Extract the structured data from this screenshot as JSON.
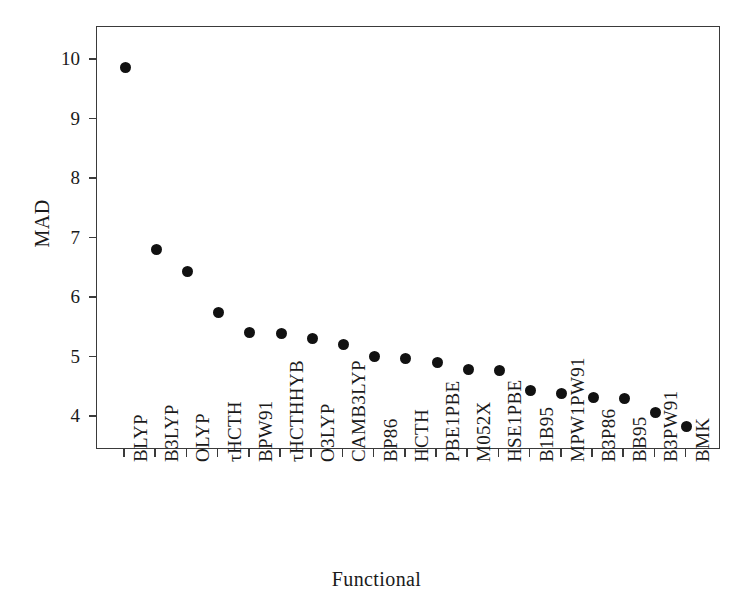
{
  "chart_data": {
    "type": "scatter",
    "title": "",
    "xlabel": "Functional",
    "ylabel": "MAD",
    "categories": [
      "BLYP",
      "B3LYP",
      "OLYP",
      "τHCTH",
      "BPW91",
      "τHCTHHYB",
      "O3LYP",
      "CAMB3LYP",
      "BP86",
      "HCTH",
      "PBE1PBE",
      "M052X",
      "HSE1PBE",
      "B1B95",
      "MPW1PW91",
      "B3P86",
      "BB95",
      "B3PW91",
      "BMK"
    ],
    "values": [
      9.88,
      6.82,
      6.44,
      5.76,
      5.42,
      5.4,
      5.32,
      5.22,
      5.02,
      4.99,
      4.91,
      4.8,
      4.78,
      4.45,
      4.4,
      4.32,
      4.31,
      4.07,
      3.84
    ],
    "ytick_labels": [
      "10",
      "9",
      "8",
      "7",
      "6",
      "5",
      "4"
    ],
    "ytick_values": [
      10,
      9,
      8,
      7,
      6,
      5,
      4
    ],
    "ylim": [
      3.33,
      10.45
    ],
    "xlim": [
      0,
      20
    ],
    "grid": false,
    "legend": null,
    "marker": "filled-circle",
    "marker_color": "#111111",
    "frame_color": "#3a3a3a",
    "background": "#ffffff"
  }
}
